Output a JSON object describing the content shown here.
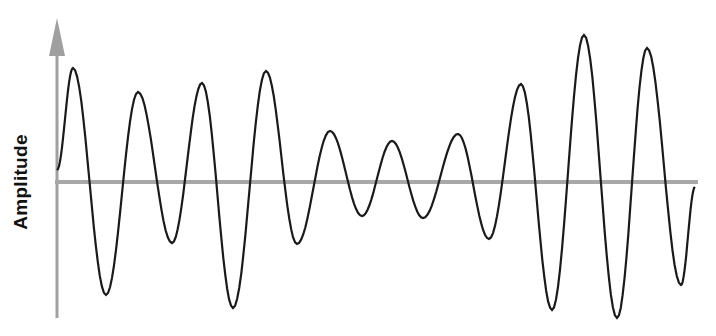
{
  "diagram": {
    "ylabel": "Amplitude",
    "axis_color": "#a0a0a0",
    "wave_color": "#1a1a1a",
    "baseline_y": 182,
    "extrema": [
      [
        57,
        170
      ],
      [
        73,
        68
      ],
      [
        106,
        295
      ],
      [
        138,
        92
      ],
      [
        172,
        243
      ],
      [
        202,
        83
      ],
      [
        233,
        308
      ],
      [
        266,
        71
      ],
      [
        297,
        244
      ],
      [
        330,
        131
      ],
      [
        362,
        216
      ],
      [
        392,
        141
      ],
      [
        423,
        218
      ],
      [
        458,
        134
      ],
      [
        489,
        239
      ],
      [
        521,
        84
      ],
      [
        552,
        310
      ],
      [
        584,
        35
      ],
      [
        617,
        318
      ],
      [
        647,
        48
      ],
      [
        681,
        285
      ],
      [
        695,
        187
      ]
    ]
  },
  "chart_data": {
    "type": "line",
    "title": "",
    "xlabel": "",
    "ylabel": "Amplitude",
    "relative_peak_amplitudes": [
      1.0,
      0.88,
      0.98,
      1.0,
      0.5,
      0.4,
      0.45,
      0.9,
      1.3,
      1.25
    ],
    "grid": false
  }
}
